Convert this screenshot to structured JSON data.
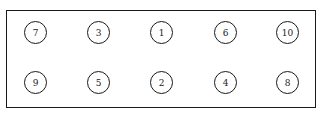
{
  "diagram": {
    "type": "numbered-position-layout",
    "rows": [
      {
        "cells": [
          {
            "label": "7"
          },
          {
            "label": "3"
          },
          {
            "label": "1"
          },
          {
            "label": "6"
          },
          {
            "label": "10"
          }
        ]
      },
      {
        "cells": [
          {
            "label": "9"
          },
          {
            "label": "5"
          },
          {
            "label": "2"
          },
          {
            "label": "4"
          },
          {
            "label": "8"
          }
        ]
      }
    ],
    "colors": {
      "stroke": "#1a1a1a",
      "background": "#ffffff"
    }
  }
}
